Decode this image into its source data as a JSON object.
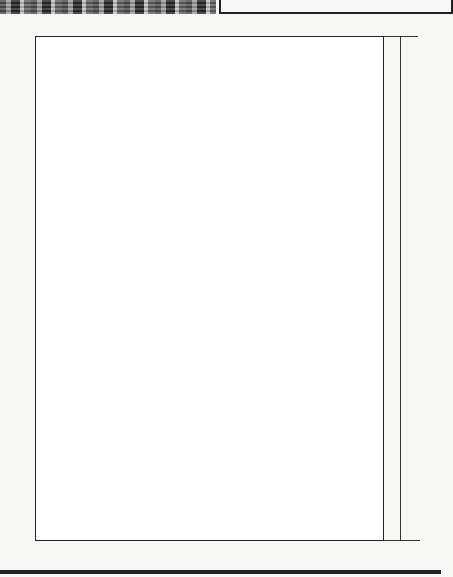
{
  "header": {
    "photo_strip": "knitted-fabric-photo",
    "caption_box": ""
  },
  "chart": {
    "columns": 36,
    "rows": 68,
    "row_labels": [
      "1",
      "5",
      "10",
      "15",
      "20",
      "25",
      "30",
      "35",
      "40",
      "45",
      "50",
      "55",
      "60",
      "65"
    ],
    "column_labels": [
      "1",
      "5",
      "10",
      "15",
      "20",
      "25",
      "30",
      "35"
    ],
    "side_labels": {
      "d": "D",
      "f": "F"
    },
    "pattern_top_to_bottom": [
      "x..xxx....xxxxxxxx.xxxxxxxx....xxx.xx",
      "..xxx........xxxx.xxx.xxxx......xxx..x",
      ".xxx........xxxx..xxx...xxxx.....xxx.x",
      ".xx..........xx...........xx.......xxx",
      ".x..........xxxxxx..........xx.....x.x",
      "xxxxxxxx.x.........xxx.x.......xxxx..x",
      "xx.....x..x.........xx.....x.x...xxx.x",
      "x......x..x.x.........xx.....x....xx.x",
      ".......xxxx..x.........x.xxxxxx....x.x",
      "........xxxx.x....x.........x.......x.x",
      ".......x...x.........x.xxx.......x...x",
      "..x......xx.xxx.xx........x......x...x",
      "xxxx........xxx...............xxxx..x",
      "...x.........xxxxx.xxx.........x.....x",
      "...x............xxxxxxxx.......x.....x",
      "......xxx.......x...x.xxx...........x",
      "......x..........x......x.....xxx....x",
      "......x..x.......x..............x....x",
      "xx....x..x.......xxx....x....x..xxx..x",
      "...xxxxx..xxx..xx..xx.xxx.xxx.xxxx...x",
      "...x..xxx.xxxx.xx..xxxxx.xxx..x..x...x",
      "x...xx..x..xxx.xxx..xxxx.xxx...xx..x.x",
      "xx..xx.x..xx..xxx..xxx..x.xxx..xx..xx",
      "x...xx..x..xxx.xx...xxx..xxx...xx...xx",
      "...x...x..xxxx..xx..xxx..xxxx..x....xx",
      "...xxxxx..xxx...xx.x..x.xx...xxxxx...x",
      "xx...x..x..x.......xx.xxx...x...x..xxx",
      "......x....x.......x......x..x.....x.x",
      ".....xxx.........x...x...x......xxx..x",
      "..x.......xxxxxxxxxxx.......x........x",
      "..x........xx.x..x..x..xx...x........x",
      "xxxx.....xxxx.....x......xxx...xxxxx.x",
      "..x......xxxx....xxx.....xxxx...x....x",
      "..x.....xx.x.....x........x..xx..x...x",
      ".......xxxxx.....x........xxxxx......x",
      "......xxxxx.....xxx.......x..xxxx....x",
      "x.....x..x......xxxxx.....x..x..x..xx",
      "xx....x..x.....xx.x.xx....x..x..x..xxx",
      "xxxxxxxx.x.....xxx....xxx...x.xxxxxxx",
      ".x....x.....xxxxxxx.xxxxxxxx.....x...x",
      ".xx........x....xxxxxx....x.......xx.x",
      ".xxx.........xxxx..xxx..xxxx......xxx.x",
      "..xxx.........xxxx.xxx..xxxx....xxx..x",
      "x...xxx...xxxxxxxxxx.xxxxxxxx.....xxxxx",
      "xx...xxx..........x..............xxx..xx",
      "xxx...xxx.........xxx..........xxx.xxxx",
      "x....x..x.........x...............x..xx",
      "xxx...x.........x.....x......x.....xxxx",
      "xxx...xxxx....xxxxxxxxx.....xxxxx....xxx",
      ".xx.....................x..x......xx.xx",
      "xxx..xxx..........x............xxx.xxx.",
      "x.....x....x......x......x.....x......xx",
      "xx....x..x.x.....xxx.....x...x..x...xxx",
      "x..xxxxx..x.xxx..xx..xx.x.xxxxx.xxxx..xx",
      "...x...x..xxxxx..xx......xx.xxxx.x...x..x",
      "...xx..x..x..xxx..........xxx..x.xx..xx.",
      "....xx..x.xxx...x.xxx......xxx..xx..xx.",
      "...xx..x..x..xxx..........xxx..x.xx..xx.",
      "...x...x..xxxx..xx.....xx..xxxx..x....x",
      "x..xxxxxx..x.xxx..xx.x......xxx..xxxxxx.xx",
      "xx....x....x.......xxx.x...x.....x....xxx",
      "x.....x....x........x.......x.......x...xx",
      "xxx..xxx..........x..........xxx..xxx..",
      ".xx.........x.....x..x............xx...",
      "xxx..xxxxx....xxxxxxxxxxx.....xxxxx.xxx.",
      "xxx..x...........x..x.x.........x...xxxx",
      "x....x..x........x..........x..x.....xx",
      "xxx..xxx........xxx..........xxx...xxxx",
      "xx..xxx.........x.............xxx...xx."
    ]
  },
  "footer": {
    "rule": "bottom-rule"
  }
}
